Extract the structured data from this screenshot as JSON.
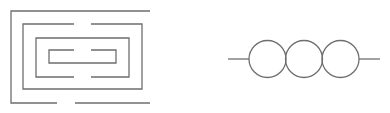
{
  "diagram": {
    "stroke_color": "#6e6e6e",
    "background_color": "#ffffff",
    "figures": [
      {
        "id": "maze",
        "type": "nested-rectangular-maze",
        "rings": 4,
        "segments": [
          [
            [
              150,
              11
            ],
            [
              11,
              11
            ],
            [
              11,
              103
            ],
            [
              57,
              103
            ]
          ],
          [
            [
              75,
              103
            ],
            [
              150,
              103
            ]
          ],
          [
            [
              74,
              24
            ],
            [
              23,
              24
            ],
            [
              23,
              89
            ],
            [
              142,
              89
            ],
            [
              142,
              24
            ],
            [
              91,
              24
            ]
          ],
          [
            [
              74,
              77
            ],
            [
              36,
              77
            ],
            [
              36,
              38
            ],
            [
              129,
              38
            ],
            [
              129,
              77
            ],
            [
              91,
              77
            ]
          ],
          [
            [
              74,
              50
            ],
            [
              49,
              50
            ],
            [
              49,
              63
            ],
            [
              116,
              63
            ],
            [
              116,
              50
            ],
            [
              91,
              50
            ]
          ]
        ]
      },
      {
        "id": "chain-of-circles",
        "type": "three-circles-on-line",
        "lead_left": [
          [
            228,
            59
          ],
          [
            249,
            59
          ]
        ],
        "lead_right": [
          [
            359,
            59
          ],
          [
            380,
            59
          ]
        ],
        "circles": [
          {
            "cx": 267.5,
            "cy": 59,
            "r": 18.5
          },
          {
            "cx": 304,
            "cy": 59,
            "r": 18.5
          },
          {
            "cx": 340.5,
            "cy": 59,
            "r": 18.5
          }
        ]
      }
    ]
  }
}
